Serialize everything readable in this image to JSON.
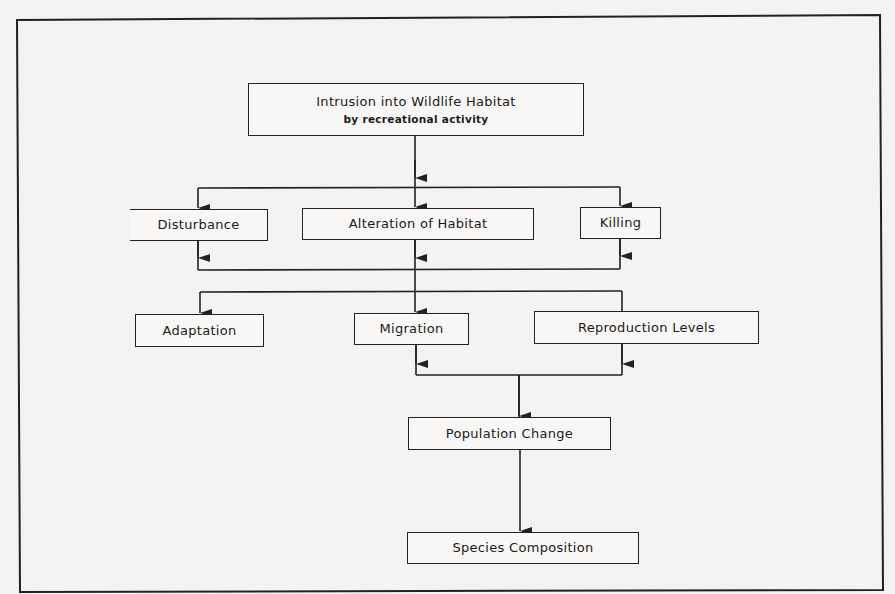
{
  "diagram": {
    "type": "flowchart",
    "nodes": {
      "intrusion": {
        "title": "Intrusion into Wildlife Habitat",
        "subtitle": "by recreational activity"
      },
      "disturbance": {
        "label": "Disturbance"
      },
      "alteration": {
        "label": "Alteration of Habitat"
      },
      "killing": {
        "label": "Killing"
      },
      "adaptation": {
        "label": "Adaptation"
      },
      "migration": {
        "label": "Migration"
      },
      "reproduction": {
        "label": "Reproduction Levels"
      },
      "population": {
        "label": "Population Change"
      },
      "species": {
        "label": "Species Composition"
      }
    },
    "edges": [
      {
        "from": "Intrusion into Wildlife Habitat",
        "to": "Disturbance"
      },
      {
        "from": "Intrusion into Wildlife Habitat",
        "to": "Alteration of Habitat"
      },
      {
        "from": "Intrusion into Wildlife Habitat",
        "to": "Killing"
      },
      {
        "from": "Disturbance / Alteration of Habitat / Killing",
        "to": "Adaptation"
      },
      {
        "from": "Disturbance / Alteration of Habitat / Killing",
        "to": "Migration"
      },
      {
        "from": "Disturbance / Alteration of Habitat / Killing",
        "to": "Reproduction Levels"
      },
      {
        "from": "Migration",
        "to": "Population Change"
      },
      {
        "from": "Reproduction Levels",
        "to": "Population Change"
      },
      {
        "from": "Population Change",
        "to": "Species Composition"
      }
    ]
  },
  "colors": {
    "line": "#222222",
    "background": "#f4f3f1"
  }
}
